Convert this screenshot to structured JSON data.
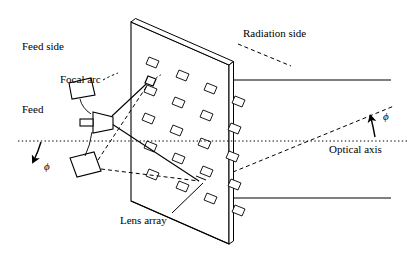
{
  "figure": {
    "type": "technical-diagram",
    "width": 408,
    "height": 265,
    "background_color": "#ffffff",
    "stroke_color": "#000000"
  },
  "labels": {
    "feed_side": "Feed side",
    "focal_arc": "Focal arc",
    "feed": "Feed",
    "radiation_side": "Radiation side",
    "optical_axis": "Optical axis",
    "lens_array": "Lens array",
    "phi_left": "ϕ",
    "phi_right": "ϕ"
  },
  "diagram": {
    "panel": {
      "name": "lens-array-panel",
      "front_face": [
        [
          131,
          22
        ],
        [
          229,
          65
        ],
        [
          229,
          244
        ],
        [
          131,
          201
        ]
      ],
      "top_edge": [
        [
          131,
          22
        ],
        [
          135,
          19
        ],
        [
          233,
          62
        ],
        [
          229,
          65
        ]
      ],
      "side_face": [
        [
          229,
          65
        ],
        [
          233,
          62
        ],
        [
          233,
          241
        ],
        [
          229,
          244
        ]
      ],
      "thickness_px": 4
    },
    "lens_elements": {
      "name": "lens-element-grid",
      "rows": 5,
      "cols": 4,
      "shape": "parallelogram",
      "cell_width": 10,
      "cell_height": 8,
      "slant": 4,
      "positions": [
        [
          152,
          60
        ],
        [
          182,
          73
        ],
        [
          210,
          86
        ],
        [
          238,
          99
        ],
        [
          150,
          88
        ],
        [
          178,
          100
        ],
        [
          206,
          113
        ],
        [
          234,
          126
        ],
        [
          148,
          116
        ],
        [
          176,
          128
        ],
        [
          204,
          141
        ],
        [
          232,
          154
        ],
        [
          150,
          144
        ],
        [
          178,
          156
        ],
        [
          206,
          169
        ],
        [
          234,
          182
        ],
        [
          152,
          172
        ],
        [
          182,
          184
        ],
        [
          210,
          196
        ],
        [
          238,
          208
        ]
      ]
    },
    "feeds": [
      {
        "name": "feed-horn-focal-arc",
        "quad": [
          [
            70,
            82
          ],
          [
            90,
            78
          ],
          [
            94,
            95
          ],
          [
            72,
            98
          ]
        ],
        "leader_to": [
          [
            78,
            99
          ],
          [
            86,
            113
          ]
        ]
      },
      {
        "name": "feed-horn-center",
        "quad": [
          [
            92,
            117
          ],
          [
            112,
            111
          ],
          [
            112,
            133
          ],
          [
            92,
            127
          ]
        ],
        "stub": [
          [
            80,
            122
          ],
          [
            92,
            122
          ]
        ]
      },
      {
        "name": "feed-horn-lower",
        "quad": [
          [
            72,
            159
          ],
          [
            95,
            153
          ],
          [
            100,
            172
          ],
          [
            76,
            177
          ]
        ],
        "leader_to": [
          [
            90,
            133
          ],
          [
            84,
            155
          ]
        ]
      }
    ],
    "rays": {
      "solid_from_center_feed": [
        [
          [
            112,
            117
          ],
          [
            151,
            79
          ]
        ],
        [
          [
            112,
            128
          ],
          [
            151,
            79
          ]
        ],
        [
          [
            112,
            122
          ],
          [
            199,
            181
          ]
        ]
      ],
      "dashed_from_lower_feed": [
        [
          [
            99,
            161
          ],
          [
            151,
            79
          ]
        ],
        [
          [
            100,
            168
          ],
          [
            199,
            181
          ]
        ]
      ],
      "focal_point_marker": {
        "x": 151,
        "y": 79,
        "size": 7
      }
    },
    "optical_axis": {
      "name": "optical-axis-line",
      "style": "dotted",
      "from": [
        18,
        141
      ],
      "to": [
        408,
        141
      ]
    },
    "aperture_lines": [
      [
        [
          233,
          80
        ],
        [
          390,
          80
        ]
      ],
      [
        [
          233,
          198
        ],
        [
          390,
          198
        ]
      ]
    ],
    "beam_dashed_right": {
      "from": [
        233,
        172
      ],
      "to": [
        393,
        107
      ]
    },
    "leaders": {
      "radiation_side": [
        [
          240,
          44
        ],
        [
          290,
          66
        ]
      ],
      "lens_array": [
        [
          170,
          214
        ],
        [
          200,
          182
        ]
      ],
      "focal_arc_to_horn": [
        [
          100,
          80
        ],
        [
          112,
          76
        ]
      ]
    },
    "phi_arrows": {
      "left": {
        "name": "phi-arrow-left",
        "from": [
          40,
          144
        ],
        "to": [
          34,
          162
        ]
      },
      "right": {
        "name": "phi-arrow-right",
        "from": [
          375,
          135
        ],
        "to": [
          371,
          117
        ]
      }
    }
  }
}
